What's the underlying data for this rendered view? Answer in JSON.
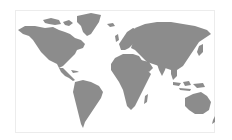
{
  "map": {
    "title": "World Map",
    "style": "grayscale silhouette",
    "colors": {
      "land": "#8c8c8c",
      "water": "#ffffff",
      "frame": "#ececec"
    },
    "regions": [
      {
        "name": "North America"
      },
      {
        "name": "Greenland"
      },
      {
        "name": "Central America"
      },
      {
        "name": "South America"
      },
      {
        "name": "Europe"
      },
      {
        "name": "Africa"
      },
      {
        "name": "Madagascar"
      },
      {
        "name": "Asia"
      },
      {
        "name": "Arabian Peninsula"
      },
      {
        "name": "Indian Subcontinent"
      },
      {
        "name": "Southeast Asia"
      },
      {
        "name": "Indonesia"
      },
      {
        "name": "Japan"
      },
      {
        "name": "Australia"
      },
      {
        "name": "New Zealand"
      },
      {
        "name": "Canadian Arctic Islands"
      },
      {
        "name": "United Kingdom"
      },
      {
        "name": "Iceland"
      }
    ]
  }
}
